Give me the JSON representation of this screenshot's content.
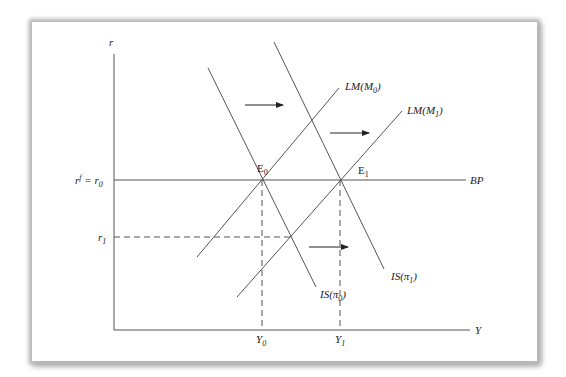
{
  "diagram": {
    "type": "IS-LM-BP",
    "axes": {
      "y_label": "r",
      "x_label": "Y"
    },
    "y_ticks": {
      "r0_label_prefix": "r",
      "r0_label_sup": "f",
      "r0_label_mid": " = r",
      "r0_label_sub": "0",
      "r1_label": "r",
      "r1_sub": "1"
    },
    "x_ticks": {
      "y0_label": "Y",
      "y0_sub": "0",
      "y1_label": "Y",
      "y1_sub": "1"
    },
    "curves": {
      "lm0": {
        "prefix": "LM(M",
        "sub": "0",
        "suffix": ")"
      },
      "lm1": {
        "prefix": "LM(M",
        "sub": "1",
        "suffix": ")"
      },
      "is0": {
        "prefix": "IS(π",
        "sub": "0",
        "suffix": ")"
      },
      "is1": {
        "prefix": "IS(π",
        "sub": "1",
        "suffix": ")"
      },
      "bp": {
        "label": "BP"
      }
    },
    "points": {
      "e0": {
        "label": "E",
        "sub": "0"
      },
      "e1": {
        "label": "E",
        "sub": "1"
      }
    },
    "colors": {
      "line": "#555555",
      "text": "#222222",
      "frame_shadow": "#b0b0b0"
    }
  }
}
